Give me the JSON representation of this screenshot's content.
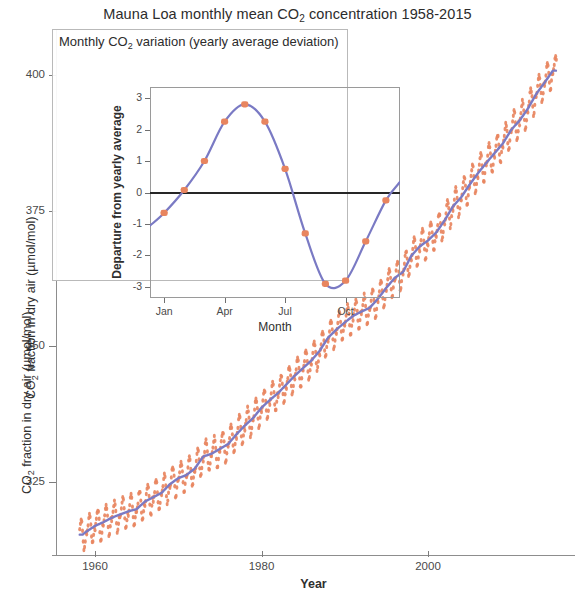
{
  "figure": {
    "width": 575,
    "height": 599,
    "background": "#ffffff"
  },
  "main": {
    "title_prefix": "Mauna Loa monthly mean CO",
    "title_sub": "2",
    "title_suffix": " concentration 1958-2015",
    "ylabel_prefix": "CO",
    "ylabel_sub": "2",
    "ylabel_suffix": " fraction in dry air (µmol/mol)",
    "xlabel": "Year",
    "y_ticks": [
      "400",
      "375",
      "350",
      "325"
    ],
    "x_ticks": [
      "1960",
      "1980",
      "2000"
    ]
  },
  "inset": {
    "title_prefix": "Monthly CO",
    "title_sub": "2",
    "title_suffix": " variation (yearly average deviation)",
    "ylabel": "Departure from yearly average",
    "xlabel": "Month",
    "y_ticks": [
      "3",
      "2",
      "1",
      "0",
      "-1",
      "-2",
      "-3"
    ],
    "x_ticks": [
      "Jan",
      "Apr",
      "Jul",
      "Oct"
    ]
  },
  "colors": {
    "scatter": "#e8855f",
    "trend_line": "#7a7ac4",
    "zero_line": "#262626",
    "axis": "#8d8d8d",
    "text": "#2f2f2f"
  },
  "chart_data": [
    {
      "type": "scatter",
      "name": "main",
      "title": "Mauna Loa monthly mean CO2 concentration 1958-2015",
      "xlabel": "Year",
      "ylabel": "CO2 fraction in dry air (µmol/mol)",
      "xlim": [
        1958,
        2015.5
      ],
      "ylim": [
        312,
        404
      ],
      "xticks": [
        1960,
        1980,
        2000
      ],
      "yticks": [
        325,
        350,
        375,
        400
      ],
      "grid": false,
      "legend": null,
      "series": [
        {
          "name": "Monthly mean CO2",
          "marker": "dot",
          "color": "#e8855f",
          "note": "Monthly values: annual trend plus seasonal cycle of roughly +/-3 umol/mol, peak in May, minimum in late September/October.",
          "x": [
            1958.5,
            1959,
            1960,
            1961,
            1962,
            1963,
            1964,
            1965,
            1966,
            1967,
            1968,
            1969,
            1970,
            1971,
            1972,
            1973,
            1974,
            1975,
            1976,
            1977,
            1978,
            1979,
            1980,
            1981,
            1982,
            1983,
            1984,
            1985,
            1986,
            1987,
            1988,
            1989,
            1990,
            1991,
            1992,
            1993,
            1994,
            1995,
            1996,
            1997,
            1998,
            1999,
            2000,
            2001,
            2002,
            2003,
            2004,
            2005,
            2006,
            2007,
            2008,
            2009,
            2010,
            2011,
            2012,
            2013,
            2014,
            2015
          ],
          "y": [
            315.3,
            315.9,
            316.9,
            317.6,
            318.4,
            319.0,
            319.6,
            320.0,
            321.4,
            322.2,
            323.0,
            324.6,
            325.7,
            326.3,
            327.5,
            329.7,
            330.2,
            331.1,
            332.0,
            333.8,
            335.4,
            336.8,
            338.7,
            340.1,
            341.4,
            343.0,
            344.6,
            346.0,
            347.4,
            349.2,
            351.6,
            353.1,
            354.4,
            355.6,
            356.4,
            357.1,
            358.8,
            360.8,
            362.6,
            363.7,
            366.7,
            368.4,
            369.5,
            371.0,
            373.2,
            375.8,
            377.5,
            379.8,
            381.9,
            383.8,
            385.6,
            387.4,
            389.9,
            391.6,
            393.8,
            396.5,
            398.6,
            400.8
          ]
        },
        {
          "name": "Smoothed annual trend",
          "marker": "line",
          "color": "#7a7ac4",
          "x": [
            1958.5,
            1962,
            1966,
            1970,
            1974,
            1978,
            1982,
            1986,
            1990,
            1994,
            1998,
            2002,
            2006,
            2010,
            2015
          ],
          "y": [
            315.3,
            318.4,
            321.4,
            325.7,
            330.2,
            335.4,
            341.4,
            347.4,
            354.4,
            358.8,
            366.7,
            373.2,
            381.9,
            389.9,
            400.8
          ]
        }
      ]
    },
    {
      "type": "line",
      "name": "inset",
      "title": "Monthly CO2 variation (yearly average deviation)",
      "xlabel": "Month",
      "ylabel": "Departure from yearly average",
      "xlim": [
        0.3,
        12.7
      ],
      "ylim": [
        -3.35,
        3.35
      ],
      "xticks": [
        1,
        4,
        7,
        10
      ],
      "xticklabels": [
        "Jan",
        "Apr",
        "Jul",
        "Oct"
      ],
      "yticks": [
        -3,
        -2,
        -1,
        0,
        1,
        2,
        3
      ],
      "grid": false,
      "zero_line": 0,
      "legend": null,
      "series": [
        {
          "name": "Departure from yearly average",
          "marker": "dot+line",
          "color": "#e8855f",
          "line_color": "#7a7ac4",
          "categories": [
            "Jan",
            "Feb",
            "Mar",
            "Apr",
            "May",
            "Jun",
            "Jul",
            "Aug",
            "Sep",
            "Oct",
            "Nov",
            "Dec"
          ],
          "x": [
            1,
            2,
            3,
            4,
            5,
            6,
            7,
            8,
            9,
            10,
            11,
            12
          ],
          "values": [
            -0.65,
            0.08,
            1.0,
            2.25,
            2.8,
            2.25,
            0.75,
            -1.3,
            -2.9,
            -2.8,
            -1.55,
            -0.25
          ]
        }
      ]
    }
  ]
}
